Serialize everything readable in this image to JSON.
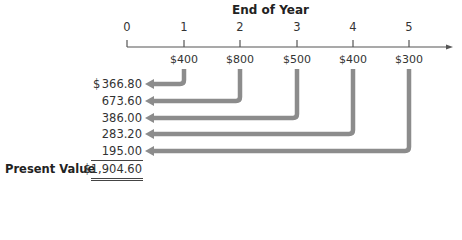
{
  "title": "End of Year",
  "timeline": {
    "periods": [
      "0",
      "1",
      "2",
      "3",
      "4",
      "5"
    ],
    "tick_x": [
      127,
      184,
      240,
      297,
      353,
      409
    ]
  },
  "cash_flows": [
    {
      "year": "1",
      "amount": "$400",
      "present_value": "366.80"
    },
    {
      "year": "2",
      "amount": "$800",
      "present_value": "673.60"
    },
    {
      "year": "3",
      "amount": "$500",
      "present_value": "386.00"
    },
    {
      "year": "4",
      "amount": "$400",
      "present_value": "283.20"
    },
    {
      "year": "5",
      "amount": "$300",
      "present_value": "195.00"
    }
  ],
  "currency_symbol": "$",
  "present_value": {
    "label": "Present Value",
    "total": "$1,904.60"
  },
  "colors": {
    "arrow": "#8c8c8c",
    "axis": "#555555"
  }
}
